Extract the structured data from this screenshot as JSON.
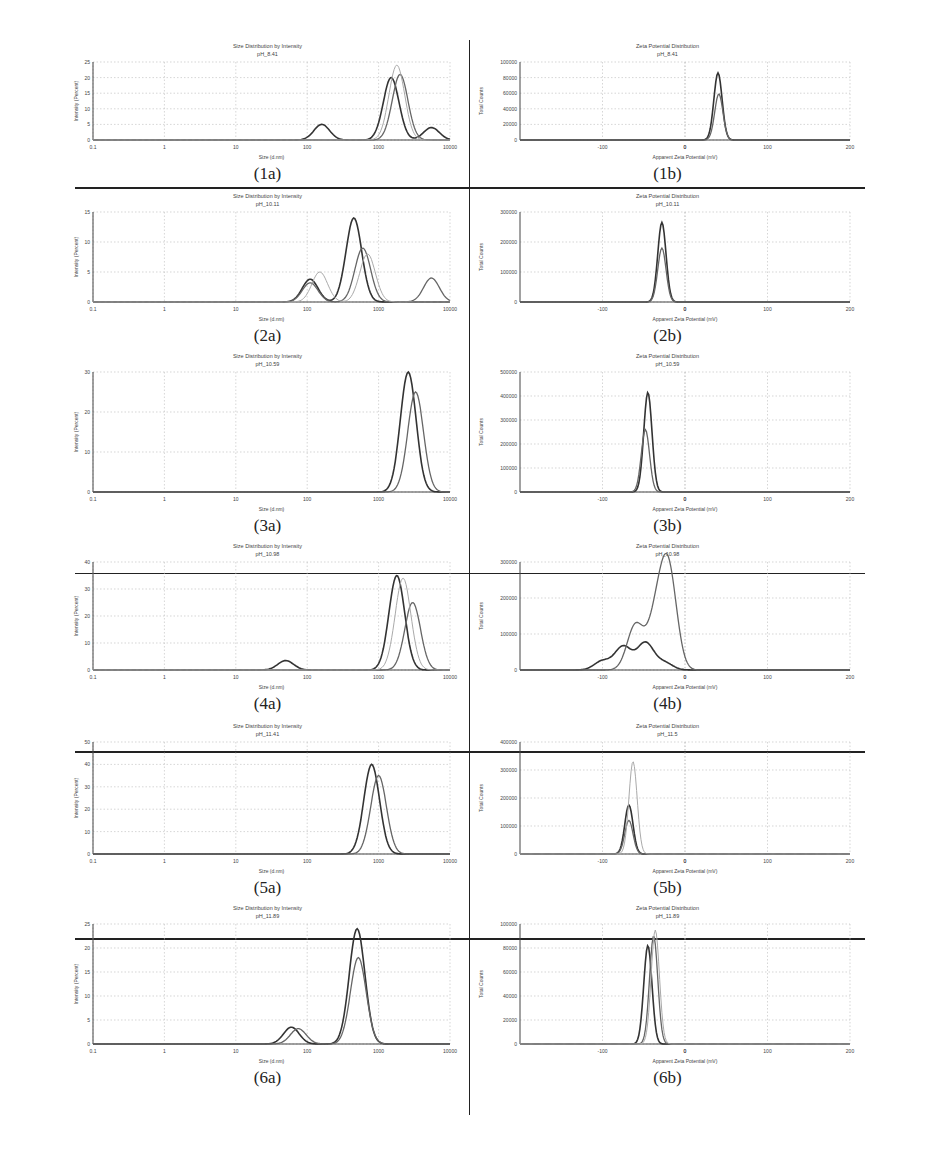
{
  "figure": {
    "panels": [
      {
        "id": "1a",
        "caption": "(1a)",
        "title": "Size Distribution by Intensity",
        "subtitle": "pH_8.41",
        "xlabel": "Size (d.nm)",
        "ylabel": "Intensity (Percent)"
      },
      {
        "id": "1b",
        "caption": "(1b)",
        "title": "Zeta Potential Distribution",
        "subtitle": "pH_8.41",
        "xlabel": "Apparent Zeta Potential (mV)",
        "ylabel": "Total Counts"
      },
      {
        "id": "2a",
        "caption": "(2a)",
        "title": "Size Distribution by Intensity",
        "subtitle": "pH_10.11",
        "xlabel": "Size (d.nm)",
        "ylabel": "Intensity (Percent)"
      },
      {
        "id": "2b",
        "caption": "(2b)",
        "title": "Zeta Potential Distribution",
        "subtitle": "pH_10.11",
        "xlabel": "Apparent Zeta Potential (mV)",
        "ylabel": "Total Counts"
      },
      {
        "id": "3a",
        "caption": "(3a)",
        "title": "Size Distribution by Intensity",
        "subtitle": "pH_10.59",
        "xlabel": "Size (d.nm)",
        "ylabel": "Intensity (Percent)"
      },
      {
        "id": "3b",
        "caption": "(3b)",
        "title": "Zeta Potential Distribution",
        "subtitle": "pH_10.59",
        "xlabel": "Apparent Zeta Potential (mV)",
        "ylabel": "Total Counts"
      },
      {
        "id": "4a",
        "caption": "(4a)",
        "title": "Size Distribution by Intensity",
        "subtitle": "pH_10.98",
        "xlabel": "Size (d.nm)",
        "ylabel": "Intensity (Percent)"
      },
      {
        "id": "4b",
        "caption": "(4b)",
        "title": "Zeta Potential Distribution",
        "subtitle": "pH_10.98",
        "xlabel": "Apparent Zeta Potential (mV)",
        "ylabel": "Total Counts"
      },
      {
        "id": "5a",
        "caption": "(5a)",
        "title": "Size Distribution by Intensity",
        "subtitle": "pH_11.41",
        "xlabel": "Size (d.nm)",
        "ylabel": "Intensity (Percent)"
      },
      {
        "id": "5b",
        "caption": "(5b)",
        "title": "Zeta Potential Distribution",
        "subtitle": "pH_11.5",
        "xlabel": "Apparent Zeta Potential (mV)",
        "ylabel": "Total Counts"
      },
      {
        "id": "6a",
        "caption": "(6a)",
        "title": "Size Distribution by Intensity",
        "subtitle": "pH_11.89",
        "xlabel": "Size (d.nm)",
        "ylabel": "Intensity (Percent)"
      },
      {
        "id": "6b",
        "caption": "(6b)",
        "title": "Zeta Potential Distribution",
        "subtitle": "pH_11.89",
        "xlabel": "Apparent Zeta Potential (mV)",
        "ylabel": "Total Counts"
      }
    ]
  },
  "chart_data": [
    {
      "id": "1a",
      "type": "line",
      "title": "Size Distribution by Intensity",
      "subtitle": "pH_8.41",
      "xlabel": "Size (d.nm)",
      "ylabel": "Intensity (Percent)",
      "xscale": "log",
      "xlim": [
        0.1,
        10000
      ],
      "xticks": [
        "0.1",
        "1",
        "10",
        "100",
        "1000",
        "10000"
      ],
      "ylim": [
        0,
        25
      ],
      "yticks": [
        "0",
        "5",
        "10",
        "15",
        "20",
        "25"
      ],
      "grid": true,
      "series": [
        {
          "name": "run 1",
          "peaks": [
            {
              "x": 160,
              "y": 5
            },
            {
              "x": 1500,
              "y": 20
            },
            {
              "x": 5500,
              "y": 4
            }
          ]
        },
        {
          "name": "run 2",
          "peaks": [
            {
              "x": 2000,
              "y": 21
            }
          ]
        },
        {
          "name": "run 3",
          "peaks": [
            {
              "x": 1800,
              "y": 24
            }
          ]
        }
      ]
    },
    {
      "id": "1b",
      "type": "line",
      "title": "Zeta Potential Distribution",
      "subtitle": "pH_8.41",
      "xlabel": "Apparent Zeta Potential (mV)",
      "ylabel": "Total Counts",
      "xlim": [
        -200,
        200
      ],
      "xticks": [
        "-100",
        "0",
        "100",
        "200"
      ],
      "ylim": [
        0,
        100000
      ],
      "yticks": [
        "0",
        "20000",
        "40000",
        "60000",
        "80000",
        "100000"
      ],
      "grid": true,
      "series": [
        {
          "name": "run 1",
          "peaks": [
            {
              "x": 40,
              "y": 86000
            }
          ]
        },
        {
          "name": "run 2",
          "peaks": [
            {
              "x": 41,
              "y": 59000
            }
          ]
        }
      ]
    },
    {
      "id": "2a",
      "type": "line",
      "title": "Size Distribution by Intensity",
      "subtitle": "pH_10.11",
      "xlabel": "Size (d.nm)",
      "ylabel": "Intensity (Percent)",
      "xscale": "log",
      "xlim": [
        0.1,
        10000
      ],
      "xticks": [
        "0.1",
        "1",
        "10",
        "100",
        "1000",
        "10000"
      ],
      "ylim": [
        0,
        15
      ],
      "yticks": [
        "0",
        "5",
        "10",
        "15"
      ],
      "grid": true,
      "series": [
        {
          "name": "run 1",
          "peaks": [
            {
              "x": 110,
              "y": 3.8
            },
            {
              "x": 450,
              "y": 14
            }
          ]
        },
        {
          "name": "run 2",
          "peaks": [
            {
              "x": 110,
              "y": 3.2
            },
            {
              "x": 600,
              "y": 9
            },
            {
              "x": 5500,
              "y": 4
            }
          ]
        },
        {
          "name": "run 3",
          "peaks": [
            {
              "x": 150,
              "y": 5
            },
            {
              "x": 700,
              "y": 8
            }
          ]
        }
      ]
    },
    {
      "id": "2b",
      "type": "line",
      "title": "Zeta Potential Distribution",
      "subtitle": "pH_10.11",
      "xlabel": "Apparent Zeta Potential (mV)",
      "ylabel": "Total Counts",
      "xlim": [
        -200,
        200
      ],
      "xticks": [
        "-100",
        "0",
        "100",
        "200"
      ],
      "ylim": [
        0,
        300000
      ],
      "yticks": [
        "0",
        "100000",
        "200000",
        "300000"
      ],
      "grid": true,
      "series": [
        {
          "name": "run 1",
          "peaks": [
            {
              "x": -28,
              "y": 265000
            }
          ]
        },
        {
          "name": "run 2",
          "peaks": [
            {
              "x": -28,
              "y": 180000
            }
          ]
        }
      ]
    },
    {
      "id": "3a",
      "type": "line",
      "title": "Size Distribution by Intensity",
      "subtitle": "pH_10.59",
      "xlabel": "Size (d.nm)",
      "ylabel": "Intensity (Percent)",
      "xscale": "log",
      "xlim": [
        0.1,
        10000
      ],
      "xticks": [
        "0.1",
        "1",
        "10",
        "100",
        "1000",
        "10000"
      ],
      "ylim": [
        0,
        30
      ],
      "yticks": [
        "0",
        "10",
        "20",
        "30"
      ],
      "grid": true,
      "series": [
        {
          "name": "run 1",
          "peaks": [
            {
              "x": 2600,
              "y": 30
            }
          ]
        },
        {
          "name": "run 2",
          "peaks": [
            {
              "x": 3300,
              "y": 25
            }
          ]
        }
      ]
    },
    {
      "id": "3b",
      "type": "line",
      "title": "Zeta Potential Distribution",
      "subtitle": "pH_10.59",
      "xlabel": "Apparent Zeta Potential (mV)",
      "ylabel": "Total Counts",
      "xlim": [
        -200,
        200
      ],
      "xticks": [
        "-100",
        "0",
        "100",
        "200"
      ],
      "ylim": [
        0,
        500000
      ],
      "yticks": [
        "0",
        "100000",
        "200000",
        "300000",
        "400000",
        "500000"
      ],
      "grid": true,
      "series": [
        {
          "name": "run 1",
          "peaks": [
            {
              "x": -45,
              "y": 415000
            }
          ]
        },
        {
          "name": "run 2",
          "peaks": [
            {
              "x": -48,
              "y": 260000
            }
          ]
        }
      ]
    },
    {
      "id": "4a",
      "type": "line",
      "title": "Size Distribution by Intensity",
      "subtitle": "pH_10.98",
      "xlabel": "Size (d.nm)",
      "ylabel": "Intensity (Percent)",
      "xscale": "log",
      "xlim": [
        0.1,
        10000
      ],
      "xticks": [
        "0.1",
        "1",
        "10",
        "100",
        "1000",
        "10000"
      ],
      "ylim": [
        0,
        40
      ],
      "yticks": [
        "0",
        "10",
        "20",
        "30",
        "40"
      ],
      "grid": true,
      "series": [
        {
          "name": "run 1",
          "peaks": [
            {
              "x": 50,
              "y": 3.5
            },
            {
              "x": 1800,
              "y": 35
            }
          ]
        },
        {
          "name": "run 2",
          "peaks": [
            {
              "x": 3000,
              "y": 25
            }
          ]
        },
        {
          "name": "run 3",
          "peaks": [
            {
              "x": 2200,
              "y": 34
            }
          ]
        }
      ]
    },
    {
      "id": "4b",
      "type": "line",
      "title": "Zeta Potential Distribution",
      "subtitle": "pH_10.98",
      "xlabel": "Apparent Zeta Potential (mV)",
      "ylabel": "Total Counts",
      "xlim": [
        -200,
        200
      ],
      "xticks": [
        "-100",
        "0",
        "100",
        "200"
      ],
      "ylim": [
        0,
        300000
      ],
      "yticks": [
        "0",
        "100000",
        "200000",
        "300000"
      ],
      "grid": true,
      "series": [
        {
          "name": "run 1",
          "peaks": [
            {
              "x": -100,
              "y": 25000
            },
            {
              "x": -75,
              "y": 65000
            },
            {
              "x": -48,
              "y": 75000
            },
            {
              "x": -25,
              "y": 20000
            }
          ]
        },
        {
          "name": "run 2",
          "peaks": [
            {
              "x": -60,
              "y": 125000
            },
            {
              "x": -35,
              "y": 135000
            },
            {
              "x": -20,
              "y": 270000
            }
          ]
        }
      ]
    },
    {
      "id": "5a",
      "type": "line",
      "title": "Size Distribution by Intensity",
      "subtitle": "pH_11.41",
      "xlabel": "Size (d.nm)",
      "ylabel": "Intensity (Percent)",
      "xscale": "log",
      "xlim": [
        0.1,
        10000
      ],
      "xticks": [
        "0.1",
        "1",
        "10",
        "100",
        "1000",
        "10000"
      ],
      "ylim": [
        0,
        50
      ],
      "yticks": [
        "0",
        "10",
        "20",
        "30",
        "40",
        "50"
      ],
      "grid": true,
      "series": [
        {
          "name": "run 1",
          "peaks": [
            {
              "x": 800,
              "y": 40
            }
          ]
        },
        {
          "name": "run 2",
          "peaks": [
            {
              "x": 1000,
              "y": 35
            }
          ]
        }
      ]
    },
    {
      "id": "5b",
      "type": "line",
      "title": "Zeta Potential Distribution",
      "subtitle": "pH_11.5",
      "xlabel": "Apparent Zeta Potential (mV)",
      "ylabel": "Total Counts",
      "xlim": [
        -200,
        200
      ],
      "xticks": [
        "-100",
        "0",
        "100",
        "200"
      ],
      "ylim": [
        0,
        400000
      ],
      "yticks": [
        "0",
        "100000",
        "200000",
        "300000",
        "400000"
      ],
      "grid": true,
      "series": [
        {
          "name": "run 1",
          "peaks": [
            {
              "x": -68,
              "y": 175000
            }
          ]
        },
        {
          "name": "run 2",
          "peaks": [
            {
              "x": -68,
              "y": 120000
            }
          ]
        },
        {
          "name": "run 3",
          "peaks": [
            {
              "x": -63,
              "y": 330000
            }
          ]
        }
      ]
    },
    {
      "id": "6a",
      "type": "line",
      "title": "Size Distribution by Intensity",
      "subtitle": "pH_11.89",
      "xlabel": "Size (d.nm)",
      "ylabel": "Intensity (Percent)",
      "xscale": "log",
      "xlim": [
        0.1,
        10000
      ],
      "xticks": [
        "0.1",
        "1",
        "10",
        "100",
        "1000",
        "10000"
      ],
      "ylim": [
        0,
        25
      ],
      "yticks": [
        "0",
        "5",
        "10",
        "15",
        "20",
        "25"
      ],
      "grid": true,
      "series": [
        {
          "name": "run 1",
          "peaks": [
            {
              "x": 60,
              "y": 3.5
            },
            {
              "x": 500,
              "y": 24
            }
          ]
        },
        {
          "name": "run 2",
          "peaks": [
            {
              "x": 75,
              "y": 3.2
            },
            {
              "x": 520,
              "y": 18
            }
          ]
        }
      ]
    },
    {
      "id": "6b",
      "type": "line",
      "title": "Zeta Potential Distribution",
      "subtitle": "pH_11.89",
      "xlabel": "Apparent Zeta Potential (mV)",
      "ylabel": "Total Counts",
      "xlim": [
        -200,
        200
      ],
      "xticks": [
        "-100",
        "0",
        "100",
        "200"
      ],
      "ylim": [
        0,
        100000
      ],
      "yticks": [
        "0",
        "20000",
        "40000",
        "60000",
        "80000",
        "100000"
      ],
      "grid": true,
      "series": [
        {
          "name": "run 1",
          "peaks": [
            {
              "x": -45,
              "y": 82000
            }
          ]
        },
        {
          "name": "run 2",
          "peaks": [
            {
              "x": -38,
              "y": 90000
            }
          ]
        },
        {
          "name": "run 3",
          "peaks": [
            {
              "x": -36,
              "y": 95000
            }
          ]
        }
      ]
    }
  ]
}
